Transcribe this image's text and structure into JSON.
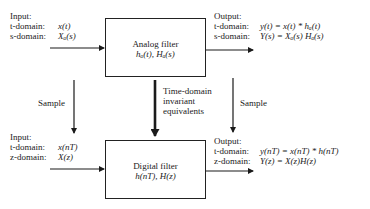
{
  "analog_filter": {
    "title": "Analog filter",
    "impulse_and_transfer": "hₐ(t), Hₐ(s)"
  },
  "digital_filter": {
    "title": "Digital filter",
    "impulse_and_transfer": "h(nT), H(z)"
  },
  "analog_input": {
    "heading": "Input:",
    "t_label": "t-domain:",
    "t_value": "x(t)",
    "s_label": "s-domain:",
    "s_value": "Xₐ(s)"
  },
  "analog_output": {
    "heading": "Output:",
    "t_label": "t-domain:",
    "t_value": "y(t) = x(t) * hₐ(t)",
    "s_label": "s-domain:",
    "s_value": "Y(s) = Xₐ(s) Hₐ(s)"
  },
  "digital_input": {
    "heading": "Input:",
    "t_label": "t-domain:",
    "t_value": "x(nT)",
    "z_label": "z-domain:",
    "z_value": "X(z)"
  },
  "digital_output": {
    "heading": "Output:",
    "t_label": "t-domain:",
    "t_value": "y(nT) = x(nT) * h(nT)",
    "z_label": "z-domain:",
    "z_value": "Y(z) = X(z)H(z)"
  },
  "arrows": {
    "left_sample_label": "Sample",
    "right_sample_label": "Sample",
    "center_label_line1": "Time-domain",
    "center_label_line2": "invariant",
    "center_label_line3": "equivalents"
  },
  "colors": {
    "ink": "#1a1a1a",
    "background": "#ffffff"
  }
}
